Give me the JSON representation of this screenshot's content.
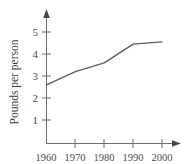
{
  "chart_data": {
    "type": "line",
    "title": "",
    "xlabel": "",
    "ylabel": "Pounds per person",
    "x": [
      1960,
      1970,
      1980,
      1990,
      2000
    ],
    "values": [
      2.6,
      3.2,
      3.6,
      4.45,
      4.55
    ],
    "series": [
      {
        "name": "Pounds per person",
        "values": [
          2.6,
          3.2,
          3.6,
          4.45,
          4.55
        ]
      }
    ],
    "xtick_labels": [
      "1960",
      "1970",
      "1980",
      "1990",
      "2000"
    ],
    "ytick_labels": [
      "1",
      "2",
      "3",
      "4",
      "5"
    ],
    "ytick_values": [
      1,
      2,
      3,
      4,
      5
    ],
    "xlim": [
      1960,
      2005
    ],
    "ylim": [
      0,
      5.6
    ],
    "grid": false,
    "legend": false,
    "legend_position": "none",
    "line_color": "#5e5e5e",
    "axis_color": "#6b6b6b",
    "text_color": "#4d4d4d"
  }
}
